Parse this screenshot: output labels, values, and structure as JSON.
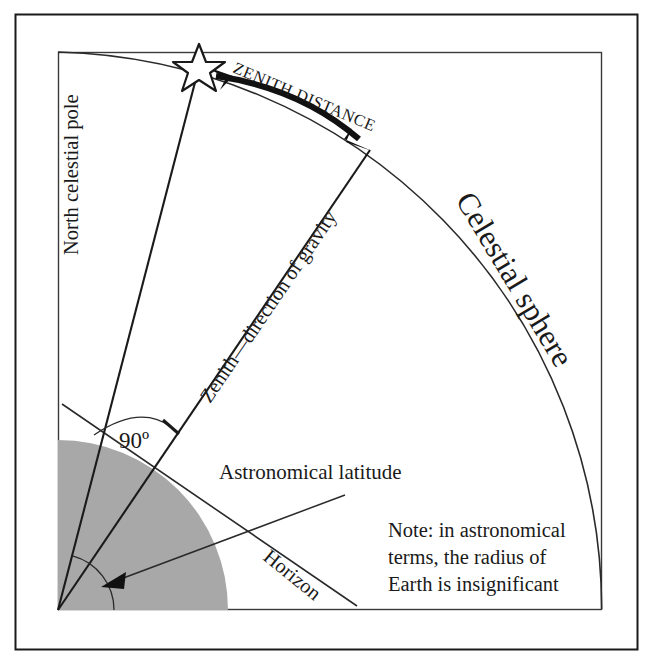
{
  "figure": {
    "kind": "astronomy-diagram",
    "title_visible": false,
    "background": "#ffffff",
    "ink": "#1a1a1a",
    "earth_fill": "#a8a8a8",
    "frame": {
      "outer": {
        "x": 15,
        "y": 14,
        "w": 623,
        "h": 636
      },
      "inner": {
        "x": 58,
        "y": 52,
        "w": 544,
        "h": 558
      }
    }
  },
  "labels": {
    "north_celestial_pole": "North celestial pole",
    "zenith_distance": "ZENITH DISTANCE",
    "celestial_sphere": "Celestial sphere",
    "zenith_direction": "Zenith—direction of gravity",
    "right_angle": "90º",
    "astronomical_latitude": "Astronomical latitude",
    "horizon": "Horizon",
    "note_line1": "Note: in astronomical",
    "note_line2": "terms, the radius of",
    "note_line3": "Earth is insignificant"
  },
  "geometry": {
    "observer_origin": {
      "x": 58,
      "y": 610
    },
    "celestial_sphere_radius": 558,
    "star_point": {
      "x": 199,
      "y": 67
    },
    "zenith_point": {
      "x": 370,
      "y": 150
    },
    "earth_radius": 170,
    "latitude_arc_radius": 56,
    "horizon_line": {
      "x1": 62,
      "y1": 404,
      "x2": 357,
      "y2": 606
    },
    "pole_line": {
      "x1": 58,
      "y1": 610,
      "x2": 199,
      "y2": 67
    },
    "zenith_line": {
      "x1": 58,
      "y1": 610,
      "x2": 370,
      "y2": 150
    },
    "latitude_leader": {
      "x1": 345,
      "y1": 495,
      "x2": 105,
      "y2": 585
    }
  },
  "annotations": {
    "zenith_distance_arrow": "double-headed-arc-arrow",
    "right_angle_marker": "arc-between-horizon-and-zenith",
    "latitude_leader_arrow": "single-headed"
  }
}
